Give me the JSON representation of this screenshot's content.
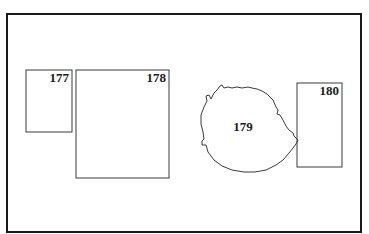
{
  "figure": {
    "frame": {
      "x": 7,
      "y": 14,
      "width": 354,
      "height": 218,
      "stroke": "#1a1a1a",
      "stroke_width": 2
    },
    "regions": [
      {
        "id": "177",
        "label": "177",
        "shape": "rect",
        "x": 26,
        "y": 70,
        "width": 46,
        "height": 62,
        "label_x": 69,
        "label_y": 82,
        "label_anchor": "end"
      },
      {
        "id": "178",
        "label": "178",
        "shape": "rect",
        "x": 76,
        "y": 70,
        "width": 93,
        "height": 108,
        "label_x": 166,
        "label_y": 82,
        "label_anchor": "end"
      },
      {
        "id": "179",
        "label": "179",
        "shape": "blob",
        "label_x": 243,
        "label_y": 131,
        "label_anchor": "middle"
      },
      {
        "id": "180",
        "label": "180",
        "shape": "rect",
        "x": 297,
        "y": 83,
        "width": 45,
        "height": 84,
        "label_x": 339,
        "label_y": 95,
        "label_anchor": "end"
      }
    ],
    "stroke_color": "#3a3a3a"
  }
}
